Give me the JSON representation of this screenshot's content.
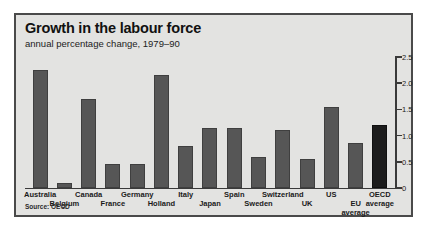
{
  "chart_data": {
    "type": "bar",
    "title": "Growth in the labour force",
    "subtitle": "annual percentage change, 1979–90",
    "xlabel": "",
    "ylabel": "",
    "ylim": [
      0,
      2.5
    ],
    "yticks": [
      "0",
      "0.5",
      "1.0",
      "1.5",
      "2.0",
      "2.5"
    ],
    "ytick_values": [
      0,
      0.5,
      1.0,
      1.5,
      2.0,
      2.5
    ],
    "y_axis_position": "right",
    "grid": false,
    "legend": "none",
    "source": "Source: OECD",
    "categories": [
      "Australia",
      "Belgium",
      "Canada",
      "France",
      "Germany",
      "Holland",
      "Italy",
      "Japan",
      "Spain",
      "Sweden",
      "Switzerland",
      "UK",
      "US",
      "EU average",
      "OECD average"
    ],
    "values": [
      2.25,
      0.1,
      1.7,
      0.45,
      0.45,
      2.15,
      0.8,
      1.15,
      1.15,
      0.6,
      1.1,
      0.55,
      1.55,
      0.85,
      1.2
    ],
    "label_rows": [
      0,
      1,
      0,
      1,
      0,
      1,
      0,
      1,
      0,
      1,
      0,
      1,
      0,
      1,
      0
    ],
    "label_lines": [
      [
        "Australia"
      ],
      [
        "Belgium"
      ],
      [
        "Canada"
      ],
      [
        "France"
      ],
      [
        "Germany"
      ],
      [
        "Holland"
      ],
      [
        "Italy"
      ],
      [
        "Japan"
      ],
      [
        "Spain"
      ],
      [
        "Sweden"
      ],
      [
        "Switzerland"
      ],
      [
        "UK"
      ],
      [
        "US"
      ],
      [
        "EU",
        "average"
      ],
      [
        "OECD",
        "average"
      ]
    ],
    "highlight_index": 14,
    "colors": {
      "bar": "#565656",
      "bar_highlight": "#1c1c1c",
      "panel": "#e3e3e1",
      "border": "#4a4a4a",
      "text": "#1a1a1a"
    }
  }
}
